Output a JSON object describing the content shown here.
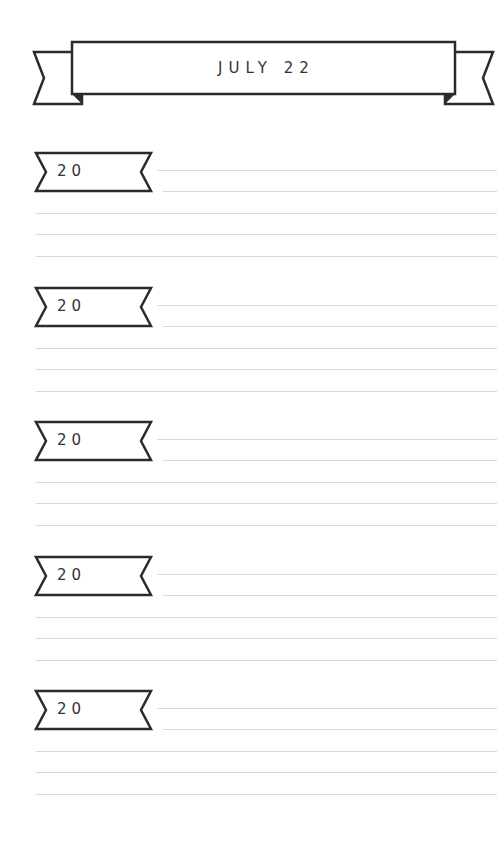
{
  "header": {
    "title": "JULY 22"
  },
  "sections": [
    {
      "year_label": "20"
    },
    {
      "year_label": "20"
    },
    {
      "year_label": "20"
    },
    {
      "year_label": "20"
    },
    {
      "year_label": "20"
    }
  ],
  "colors": {
    "ink": "#2b2b2b",
    "rule": "#d9d9d9",
    "paper": "#ffffff"
  }
}
